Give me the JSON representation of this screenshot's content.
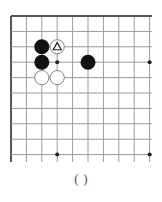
{
  "diagram": {
    "type": "go-board-fragment",
    "corner": "top-left",
    "grid": {
      "columns": 10,
      "rows": 10,
      "origin_x": 11,
      "origin_y": 16,
      "spacing": 15.4,
      "extend_right_to": 152,
      "extend_bottom_to": 162,
      "line_color": "#9a9a9a",
      "border_color": "#555555"
    },
    "star_points": [
      {
        "col": 3,
        "row": 3
      },
      {
        "col": 9,
        "row": 3
      },
      {
        "col": 3,
        "row": 9
      },
      {
        "col": 9,
        "row": 9
      }
    ],
    "stones": [
      {
        "color": "black",
        "col": 2,
        "row": 2,
        "mark": ""
      },
      {
        "color": "white",
        "col": 3,
        "row": 2,
        "mark": "triangle"
      },
      {
        "color": "black",
        "col": 2,
        "row": 3,
        "mark": ""
      },
      {
        "color": "black",
        "col": 5,
        "row": 3,
        "mark": ""
      },
      {
        "color": "white",
        "col": 2,
        "row": 4,
        "mark": ""
      },
      {
        "color": "white",
        "col": 3,
        "row": 4,
        "mark": ""
      }
    ],
    "colors": {
      "black_stone": "#111111",
      "white_stone": "#ffffff",
      "white_stone_edge": "#777777",
      "mark": "#222222"
    }
  },
  "caption": {
    "text": "(     )"
  }
}
